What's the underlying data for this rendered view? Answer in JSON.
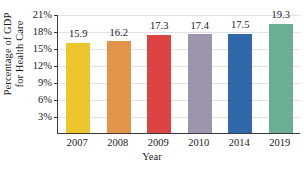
{
  "chart_data": {
    "type": "bar",
    "title": "",
    "xlabel": "Year",
    "ylabel_line1": "Percentage of GDP",
    "ylabel_line2": "for Health Care",
    "categories": [
      "2007",
      "2008",
      "2009",
      "2010",
      "2014",
      "2019"
    ],
    "values": [
      15.9,
      16.2,
      17.3,
      17.4,
      17.5,
      19.3
    ],
    "value_labels": [
      "15.9",
      "16.2",
      "17.3",
      "17.4",
      "17.5",
      "19.3"
    ],
    "colors": [
      "#EDC62D",
      "#E2954A",
      "#DC4444",
      "#9D95AE",
      "#2E68A8",
      "#6BAE94"
    ],
    "ylim": [
      0,
      21
    ],
    "ytick_values": [
      3,
      6,
      9,
      12,
      15,
      18,
      21
    ],
    "ytick_labels": [
      "3%",
      "6%",
      "9%",
      "12%",
      "15%",
      "18%",
      "21%"
    ],
    "grid": true,
    "legend": "none",
    "axis_color": "#3a3a3a",
    "gridline_color": "#dfe4ec"
  }
}
